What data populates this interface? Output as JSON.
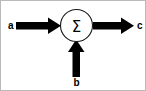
{
  "diagram": {
    "background_color": "#ffffff",
    "border_color": "#b9b9b9",
    "stroke_color": "#000000",
    "node": {
      "name": "summing-junction",
      "symbol": "Σ",
      "shape": "circle",
      "center_x": 76,
      "center_y": 25,
      "radius": 16
    },
    "signals": {
      "input_left": {
        "label": "a",
        "direction": "right",
        "label_x": 10,
        "label_y": 25
      },
      "input_bottom": {
        "label": "b",
        "direction": "up",
        "label_x": 76,
        "label_y": 83
      },
      "output_right": {
        "label": "c",
        "direction": "right",
        "label_x": 138,
        "label_y": 25
      }
    }
  }
}
